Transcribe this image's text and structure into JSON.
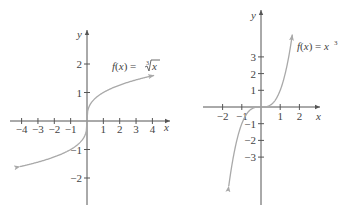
{
  "chart_data": [
    {
      "type": "line",
      "title": "f(x) = ∛x",
      "function": "cube root",
      "xlabel": "x",
      "ylabel": "y",
      "x_ticks": [
        -4,
        -3,
        -2,
        -1,
        1,
        2,
        3,
        4
      ],
      "y_ticks": [
        2,
        1,
        -1,
        -2
      ],
      "x_tick_labels": [
        "−4",
        "−3",
        "−2",
        "−1",
        "1",
        "2",
        "3",
        "4"
      ],
      "y_tick_labels": [
        "2",
        "1",
        "−1",
        "−2"
      ],
      "xlim": [
        -4.5,
        4.5
      ],
      "ylim": [
        -2.8,
        3.1
      ],
      "grid": false,
      "series": [
        {
          "name": "f(x) = ∛x",
          "x": [
            -4.1,
            -3,
            -2,
            -1,
            -0.5,
            -0.1,
            0,
            0.1,
            0.5,
            1,
            2,
            3,
            4.1
          ],
          "y": [
            -1.6,
            -1.442,
            -1.26,
            -1,
            -0.794,
            -0.464,
            0,
            0.464,
            0.794,
            1,
            1.26,
            1.442,
            1.6
          ],
          "arrows": "both"
        }
      ],
      "annotation": {
        "text_prefix": "f(x) = ",
        "radical_index": "3",
        "radicand": "x"
      }
    },
    {
      "type": "line",
      "title": "f(x) = x³",
      "function": "cube",
      "xlabel": "x",
      "ylabel": "y",
      "x_ticks": [
        -2,
        -1,
        1,
        2
      ],
      "y_ticks": [
        3,
        2,
        1,
        -1,
        -2,
        -3
      ],
      "x_tick_labels": [
        "−2",
        "−1",
        "1",
        "2"
      ],
      "y_tick_labels": [
        "3",
        "2",
        "1",
        "−1",
        "−2",
        "−3"
      ],
      "xlim": [
        -2.8,
        2.7
      ],
      "ylim": [
        -5.9,
        5.6
      ],
      "grid": false,
      "series": [
        {
          "name": "f(x) = x³",
          "x": [
            -1.68,
            -1.5,
            -1,
            -0.5,
            0,
            0.5,
            1,
            1.5,
            1.63
          ],
          "y": [
            -4.74,
            -3.375,
            -1,
            -0.125,
            0,
            0.125,
            1,
            3.375,
            4.33
          ],
          "arrows": "both"
        }
      ],
      "annotation": {
        "text_prefix": "f(x) = x",
        "superscript": "3"
      }
    }
  ]
}
